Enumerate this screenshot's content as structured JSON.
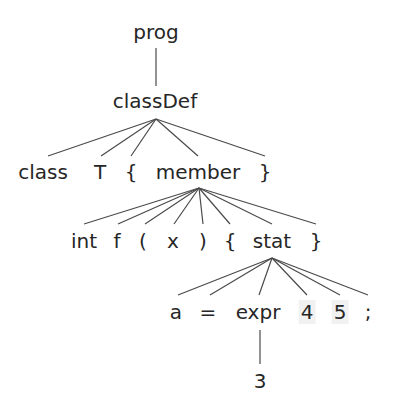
{
  "diagram": {
    "colors": {
      "text": "#262626",
      "edge": "#4a4a4a",
      "highlight": "#f1f1f1",
      "background": "#ffffff"
    },
    "nodes": [
      {
        "id": "prog",
        "label": "prog",
        "x": 156,
        "y": 32
      },
      {
        "id": "classDef",
        "label": "classDef",
        "x": 155,
        "y": 101
      },
      {
        "id": "class",
        "label": "class",
        "x": 43,
        "y": 172
      },
      {
        "id": "T",
        "label": "T",
        "x": 100,
        "y": 172
      },
      {
        "id": "lbrace1",
        "label": "{",
        "x": 131,
        "y": 172
      },
      {
        "id": "member",
        "label": "member",
        "x": 198,
        "y": 172
      },
      {
        "id": "rbrace1",
        "label": "}",
        "x": 265,
        "y": 172
      },
      {
        "id": "int",
        "label": "int",
        "x": 84,
        "y": 241
      },
      {
        "id": "f",
        "label": "f",
        "x": 117,
        "y": 241
      },
      {
        "id": "lparen",
        "label": "(",
        "x": 143,
        "y": 241
      },
      {
        "id": "x",
        "label": "x",
        "x": 173,
        "y": 241
      },
      {
        "id": "rparen",
        "label": ")",
        "x": 203,
        "y": 241
      },
      {
        "id": "lbrace2",
        "label": "{",
        "x": 230,
        "y": 241
      },
      {
        "id": "stat",
        "label": "stat",
        "x": 272,
        "y": 241
      },
      {
        "id": "rbrace2",
        "label": "}",
        "x": 316,
        "y": 241
      },
      {
        "id": "a",
        "label": "a",
        "x": 176,
        "y": 312
      },
      {
        "id": "eq",
        "label": "=",
        "x": 208,
        "y": 312
      },
      {
        "id": "expr",
        "label": "expr",
        "x": 258,
        "y": 312
      },
      {
        "id": "four",
        "label": "4",
        "x": 307,
        "y": 312,
        "highlight": true
      },
      {
        "id": "five",
        "label": "5",
        "x": 340,
        "y": 312,
        "highlight": true
      },
      {
        "id": "semi",
        "label": ";",
        "x": 368,
        "y": 312
      },
      {
        "id": "three",
        "label": "3",
        "x": 260,
        "y": 381
      }
    ],
    "edges": [
      {
        "from": "prog",
        "to": "classDef",
        "x1": 156,
        "y1": 48,
        "x2": 156,
        "y2": 86
      },
      {
        "from": "classDef",
        "to": "class",
        "x1": 156,
        "y1": 119,
        "x2": 48,
        "y2": 156
      },
      {
        "from": "classDef",
        "to": "T",
        "x1": 156,
        "y1": 119,
        "x2": 101,
        "y2": 156
      },
      {
        "from": "classDef",
        "to": "lbrace1",
        "x1": 156,
        "y1": 119,
        "x2": 131,
        "y2": 156
      },
      {
        "from": "classDef",
        "to": "member",
        "x1": 156,
        "y1": 119,
        "x2": 198,
        "y2": 156
      },
      {
        "from": "classDef",
        "to": "rbrace1",
        "x1": 156,
        "y1": 119,
        "x2": 265,
        "y2": 156
      },
      {
        "from": "member",
        "to": "int",
        "x1": 199,
        "y1": 188,
        "x2": 84,
        "y2": 224
      },
      {
        "from": "member",
        "to": "f",
        "x1": 199,
        "y1": 188,
        "x2": 118,
        "y2": 224
      },
      {
        "from": "member",
        "to": "lparen",
        "x1": 199,
        "y1": 188,
        "x2": 145,
        "y2": 224
      },
      {
        "from": "member",
        "to": "x",
        "x1": 199,
        "y1": 188,
        "x2": 174,
        "y2": 224
      },
      {
        "from": "member",
        "to": "rparen",
        "x1": 199,
        "y1": 188,
        "x2": 203,
        "y2": 224
      },
      {
        "from": "member",
        "to": "lbrace2",
        "x1": 199,
        "y1": 188,
        "x2": 230,
        "y2": 224
      },
      {
        "from": "member",
        "to": "stat",
        "x1": 199,
        "y1": 188,
        "x2": 272,
        "y2": 224
      },
      {
        "from": "member",
        "to": "rbrace2",
        "x1": 199,
        "y1": 188,
        "x2": 316,
        "y2": 224
      },
      {
        "from": "stat",
        "to": "a",
        "x1": 272,
        "y1": 258,
        "x2": 178,
        "y2": 295
      },
      {
        "from": "stat",
        "to": "eq",
        "x1": 272,
        "y1": 258,
        "x2": 210,
        "y2": 295
      },
      {
        "from": "stat",
        "to": "expr",
        "x1": 272,
        "y1": 258,
        "x2": 259,
        "y2": 295
      },
      {
        "from": "stat",
        "to": "four",
        "x1": 272,
        "y1": 258,
        "x2": 307,
        "y2": 295
      },
      {
        "from": "stat",
        "to": "five",
        "x1": 272,
        "y1": 258,
        "x2": 340,
        "y2": 295
      },
      {
        "from": "stat",
        "to": "semi",
        "x1": 272,
        "y1": 258,
        "x2": 368,
        "y2": 295
      },
      {
        "from": "expr",
        "to": "three",
        "x1": 260,
        "y1": 330,
        "x2": 260,
        "y2": 364
      }
    ]
  }
}
